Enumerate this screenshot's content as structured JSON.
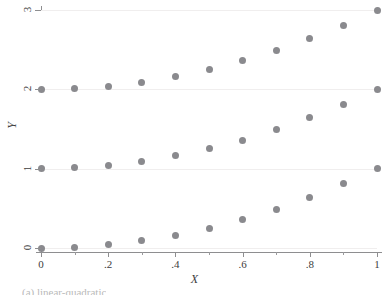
{
  "chart_data": {
    "type": "scatter",
    "title": "",
    "xlabel": "X",
    "ylabel": "Y",
    "xlim": [
      0,
      1
    ],
    "ylim": [
      0,
      3
    ],
    "grid": true,
    "legend": null,
    "marker_color": "#8a8a8e",
    "gridline_color": "#f0eeee",
    "axis_color": "#8e8e90",
    "xticks": [
      0,
      0.2,
      0.4,
      0.6,
      0.8,
      1
    ],
    "xtick_labels": [
      "0",
      ".2",
      ".4",
      ".6",
      ".8",
      "1"
    ],
    "xticks_minor": [
      0.1,
      0.3,
      0.5,
      0.7,
      0.9
    ],
    "yticks": [
      0,
      1,
      2,
      3
    ],
    "ytick_labels": [
      "0",
      "1",
      "2",
      "3"
    ],
    "x": [
      0,
      0.1,
      0.2,
      0.3,
      0.4,
      0.5,
      0.6,
      0.7,
      0.8,
      0.9,
      1
    ],
    "series": [
      {
        "name": "lower",
        "values": [
          0,
          0.01,
          0.04,
          0.09,
          0.16,
          0.25,
          0.36,
          0.49,
          0.64,
          0.81,
          1
        ]
      },
      {
        "name": "middle",
        "values": [
          1,
          1.01,
          1.04,
          1.09,
          1.16,
          1.25,
          1.36,
          1.49,
          1.64,
          1.81,
          2
        ]
      },
      {
        "name": "upper",
        "values": [
          2,
          2.01,
          2.04,
          2.09,
          2.16,
          2.25,
          2.36,
          2.49,
          2.64,
          2.81,
          3
        ]
      }
    ]
  },
  "figure": {
    "x_axis_title": "X",
    "y_axis_title": "Y",
    "caption": "(a) linear-quadratic"
  }
}
